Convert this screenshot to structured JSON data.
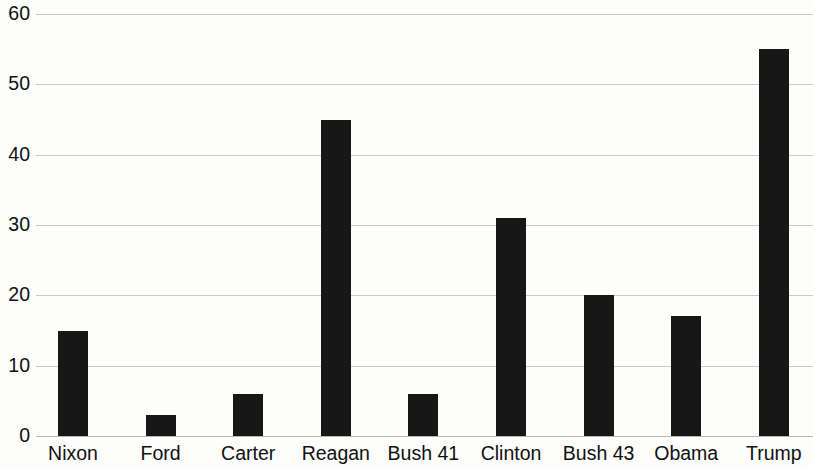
{
  "chart_data": {
    "type": "bar",
    "title": "",
    "xlabel": "",
    "ylabel": "",
    "categories": [
      "Nixon",
      "Ford",
      "Carter",
      "Reagan",
      "Bush 41",
      "Clinton",
      "Bush 43",
      "Obama",
      "Trump"
    ],
    "values": [
      15,
      3,
      6,
      45,
      6,
      31,
      20,
      17,
      55
    ],
    "ylim": [
      0,
      60
    ],
    "ytick_labels": [
      "0",
      "10",
      "20",
      "30",
      "40",
      "50",
      "60"
    ],
    "ytick_values": [
      0,
      10,
      20,
      30,
      40,
      50,
      60
    ],
    "grid": true,
    "legend": null,
    "bar_color": "#171717",
    "gridline_color": "#c9c9c9",
    "background_color": "#fdfdfc",
    "text_color": "#111111"
  }
}
